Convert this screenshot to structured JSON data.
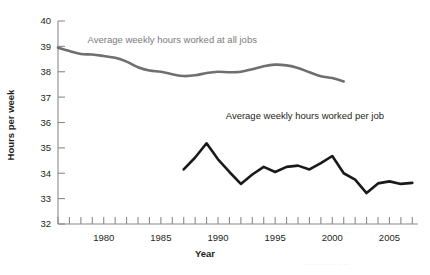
{
  "chart_data": {
    "type": "line",
    "title": "",
    "xlabel": "Year",
    "ylabel": "Hours per week",
    "xlim": [
      1976,
      2007.5
    ],
    "ylim": [
      32,
      40
    ],
    "grid": false,
    "legend_position": "inline-annotation",
    "y_ticks": [
      32,
      33,
      34,
      35,
      36,
      37,
      38,
      39,
      40
    ],
    "y_tick_labels": [
      "32",
      "33",
      "34",
      "35",
      "36",
      "37",
      "38",
      "39",
      "40"
    ],
    "x_ticks": [
      1976,
      1977,
      1978,
      1979,
      1980,
      1981,
      1982,
      1983,
      1984,
      1985,
      1986,
      1987,
      1988,
      1989,
      1990,
      1991,
      1992,
      1993,
      1994,
      1995,
      1996,
      1997,
      1998,
      1999,
      2000,
      2001,
      2002,
      2003,
      2004,
      2005,
      2006,
      2007
    ],
    "x_tick_labels_shown": [
      "1980",
      "1985",
      "1990",
      "1995",
      "2000",
      "2005"
    ],
    "x_tick_label_years": [
      1980,
      1985,
      1990,
      1995,
      2000,
      2005
    ],
    "series": [
      {
        "name": "Average weekly hours worked at all jobs",
        "color": "#6f6f6f",
        "label_x": 1986.0,
        "label_y": 39.15,
        "x": [
          1976,
          1977,
          1978,
          1979,
          1980,
          1981,
          1982,
          1983,
          1984,
          1985,
          1986,
          1987,
          1988,
          1989,
          1990,
          1991,
          1992,
          1993,
          1994,
          1995,
          1996,
          1997,
          1998,
          1999,
          2000,
          2001
        ],
        "values": [
          38.95,
          38.82,
          38.7,
          38.68,
          38.62,
          38.55,
          38.4,
          38.18,
          38.05,
          38.0,
          37.9,
          37.83,
          37.86,
          37.95,
          38.0,
          37.98,
          38.0,
          38.1,
          38.22,
          38.28,
          38.25,
          38.15,
          37.98,
          37.82,
          37.75,
          37.62
        ]
      },
      {
        "name": "Average weekly hours worked per job",
        "color": "#1a1a1a",
        "label_x": 1997.6,
        "label_y": 36.15,
        "x": [
          1987,
          1988,
          1989,
          1990,
          1991,
          1992,
          1993,
          1994,
          1995,
          1996,
          1997,
          1998,
          1999,
          2000,
          2001,
          2002,
          2003,
          2004,
          2005,
          2006,
          2007
        ],
        "values": [
          34.15,
          34.62,
          35.18,
          34.55,
          34.05,
          33.58,
          33.95,
          34.25,
          34.05,
          34.25,
          34.3,
          34.15,
          34.4,
          34.68,
          34.0,
          33.75,
          33.22,
          33.6,
          33.68,
          33.58,
          33.62
        ]
      }
    ]
  },
  "footer": {
    "artifact_text": "· ·· ··· ·  ··· ··· ·· ··· ·"
  }
}
